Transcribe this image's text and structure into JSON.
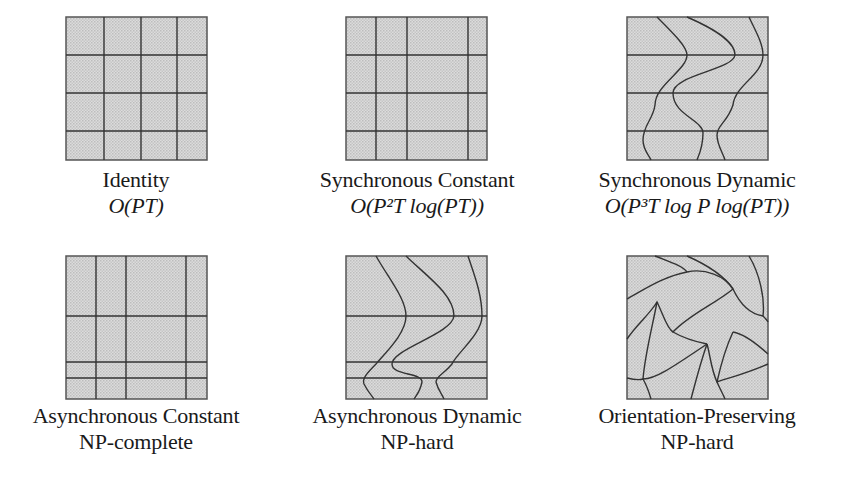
{
  "figure": {
    "fill_color": "#d6d6d6",
    "line_color": "#3a3a3a",
    "panels": [
      {
        "id": "identity",
        "title": "Identity",
        "complexity": "O(PT)"
      },
      {
        "id": "synchronous-constant",
        "title": "Synchronous Constant",
        "complexity": "O(P²T log(PT))"
      },
      {
        "id": "synchronous-dynamic",
        "title": "Synchronous Dynamic",
        "complexity": "O(P³T log P log(PT))"
      },
      {
        "id": "asynchronous-constant",
        "title": "Asynchronous Constant",
        "complexity": "NP-complete"
      },
      {
        "id": "asynchronous-dynamic",
        "title": "Asynchronous Dynamic",
        "complexity": "NP-hard"
      },
      {
        "id": "orientation-preserving",
        "title": "Orientation-Preserving",
        "complexity": "NP-hard"
      }
    ]
  }
}
